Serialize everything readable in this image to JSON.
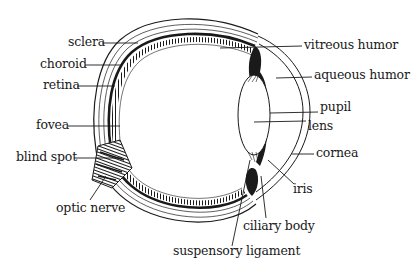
{
  "diagram": {
    "colors": {
      "ink": "#1a1a1a",
      "background": "#ffffff"
    },
    "labels": {
      "sclera": "sclera",
      "choroid": "choroid",
      "retina": "retina",
      "fovea": "fovea",
      "blind_spot": "blind spot",
      "optic_nerve": "optic nerve",
      "vitreous_humor": "vitreous humor",
      "aqueous_humor": "aqueous humor",
      "pupil": "pupil",
      "lens": "lens",
      "cornea": "cornea",
      "iris": "iris",
      "ciliary_body": "ciliary body",
      "suspensory_ligament": "suspensory ligament"
    }
  }
}
